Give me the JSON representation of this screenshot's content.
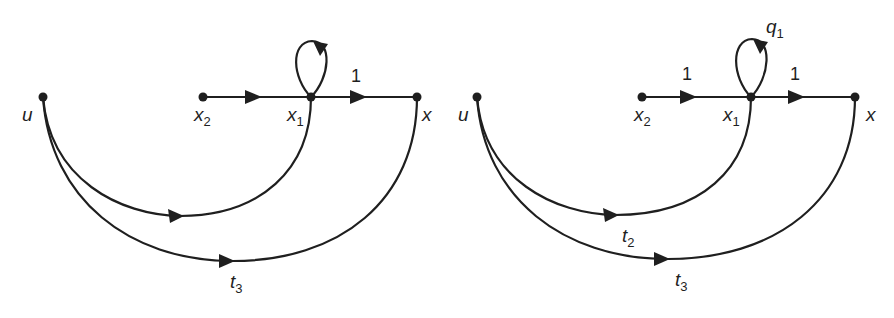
{
  "diagrams": [
    {
      "id": "left",
      "nodes": {
        "u": {
          "label": "u",
          "sub": ""
        },
        "x2": {
          "label": "x",
          "sub": "2"
        },
        "x1": {
          "label": "x",
          "sub": "1"
        },
        "x": {
          "label": "x",
          "sub": ""
        }
      },
      "edges": {
        "x2_x1": {
          "gain": ""
        },
        "x1_x": {
          "gain": "1"
        },
        "self_x1": {
          "gain": ""
        },
        "u_x1": {
          "gain": "",
          "sub": ""
        },
        "u_x": {
          "gain": "t",
          "sub": "3"
        }
      }
    },
    {
      "id": "right",
      "nodes": {
        "u": {
          "label": "u",
          "sub": ""
        },
        "x2": {
          "label": "x",
          "sub": "2"
        },
        "x1": {
          "label": "x",
          "sub": "1"
        },
        "x": {
          "label": "x",
          "sub": ""
        }
      },
      "edges": {
        "x2_x1": {
          "gain": "1"
        },
        "x1_x": {
          "gain": "1"
        },
        "self_x1": {
          "gain": "q",
          "sub": "1"
        },
        "u_x1": {
          "gain": "t",
          "sub": "2"
        },
        "u_x": {
          "gain": "t",
          "sub": "3"
        }
      }
    }
  ],
  "colors": {
    "ink": "#1f1f1f",
    "background": "#ffffff"
  }
}
